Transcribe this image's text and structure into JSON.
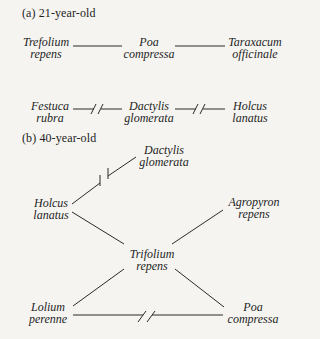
{
  "panel_a": {
    "label": "(a) 21-year-old",
    "nodes": {
      "trefolium": {
        "line1": "Trefolium",
        "line2": "repens"
      },
      "poa": {
        "line1": "Poa",
        "line2": "compressa"
      },
      "taraxacum": {
        "line1": "Taraxacum",
        "line2": "officinale"
      },
      "festuca": {
        "line1": "Festuca",
        "line2": "rubra"
      },
      "dactylis": {
        "line1": "Dactylis",
        "line2": "glomerata"
      },
      "holcus": {
        "line1": "Holcus",
        "line2": "lanatus"
      }
    },
    "edges": [
      {
        "from": "Trefolium repens",
        "to": "Poa compressa",
        "type": "positive"
      },
      {
        "from": "Poa compressa",
        "to": "Taraxacum officinale",
        "type": "positive"
      },
      {
        "from": "Festuca rubra",
        "to": "Dactylis glomerata",
        "type": "negative"
      },
      {
        "from": "Dactylis glomerata",
        "to": "Holcus lanatus",
        "type": "negative"
      }
    ]
  },
  "panel_b": {
    "label": "(b) 40-year-old",
    "nodes": {
      "dactylis": {
        "line1": "Dactylis",
        "line2": "glomerata"
      },
      "holcus": {
        "line1": "Holcus",
        "line2": "lanatus"
      },
      "agropyron": {
        "line1": "Agropyron",
        "line2": "repens"
      },
      "trifolium": {
        "line1": "Trifolium",
        "line2": "repens"
      },
      "lolium": {
        "line1": "Lolium",
        "line2": "perenne"
      },
      "poa": {
        "line1": "Poa",
        "line2": "compressa"
      }
    },
    "edges": [
      {
        "from": "Holcus lanatus",
        "to": "Dactylis glomerata",
        "type": "negative"
      },
      {
        "from": "Holcus lanatus",
        "to": "Trifolium repens",
        "type": "positive"
      },
      {
        "from": "Agropyron repens",
        "to": "Trifolium repens",
        "type": "positive"
      },
      {
        "from": "Lolium perenne",
        "to": "Trifolium repens",
        "type": "positive"
      },
      {
        "from": "Poa compressa",
        "to": "Trifolium repens",
        "type": "positive"
      },
      {
        "from": "Lolium perenne",
        "to": "Poa compressa",
        "type": "negative"
      }
    ]
  },
  "legend_note": {
    "solid_line": "positive association",
    "broken_line": "negative association"
  }
}
